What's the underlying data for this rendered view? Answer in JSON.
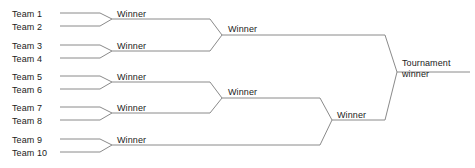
{
  "diagram": {
    "type": "single-elimination-bracket",
    "line_color": "#8a8a8a",
    "text_color": "#1b1b1b",
    "background_color": "#ffffff",
    "teams": [
      {
        "label": "Team 1",
        "x": 12,
        "y": 9
      },
      {
        "label": "Team 2",
        "x": 12,
        "y": 22
      },
      {
        "label": "Team 3",
        "x": 12,
        "y": 41
      },
      {
        "label": "Team 4",
        "x": 12,
        "y": 54
      },
      {
        "label": "Team 5",
        "x": 12,
        "y": 72
      },
      {
        "label": "Team 6",
        "x": 12,
        "y": 85
      },
      {
        "label": "Team 7",
        "x": 12,
        "y": 103
      },
      {
        "label": "Team 8",
        "x": 12,
        "y": 116
      },
      {
        "label": "Team 9",
        "x": 12,
        "y": 135
      },
      {
        "label": "Team 10",
        "x": 12,
        "y": 148
      }
    ],
    "round1_winners": [
      {
        "label": "Winner",
        "x": 117,
        "y": 9,
        "pairs": [
          "Team 1",
          "Team 2"
        ]
      },
      {
        "label": "Winner",
        "x": 117,
        "y": 41,
        "pairs": [
          "Team 3",
          "Team 4"
        ]
      },
      {
        "label": "Winner",
        "x": 117,
        "y": 72,
        "pairs": [
          "Team 5",
          "Team 6"
        ]
      },
      {
        "label": "Winner",
        "x": 117,
        "y": 103,
        "pairs": [
          "Team 7",
          "Team 8"
        ]
      },
      {
        "label": "Winner",
        "x": 117,
        "y": 135,
        "pairs": [
          "Team 9",
          "Team 10"
        ]
      }
    ],
    "round2_winners": [
      {
        "label": "Winner",
        "x": 228,
        "y": 24,
        "pairs": [
          "Winner 1-2",
          "Winner 3-4"
        ]
      },
      {
        "label": "Winner",
        "x": 228,
        "y": 87,
        "pairs": [
          "Winner 5-6",
          "Winner 7-8"
        ]
      }
    ],
    "round3_winners": [
      {
        "label": "Winner",
        "x": 337,
        "y": 110,
        "pairs": [
          "Winner R2-B",
          "Winner 9-10"
        ]
      }
    ],
    "final_winner": {
      "line1": "Tournament",
      "line2": "winner",
      "x": 402,
      "y": 58
    },
    "rounds": [
      {
        "name": "Round 1",
        "matches": 5
      },
      {
        "name": "Round 2",
        "matches": 2
      },
      {
        "name": "Round 3",
        "matches": 1
      },
      {
        "name": "Final",
        "matches": 1
      }
    ]
  }
}
